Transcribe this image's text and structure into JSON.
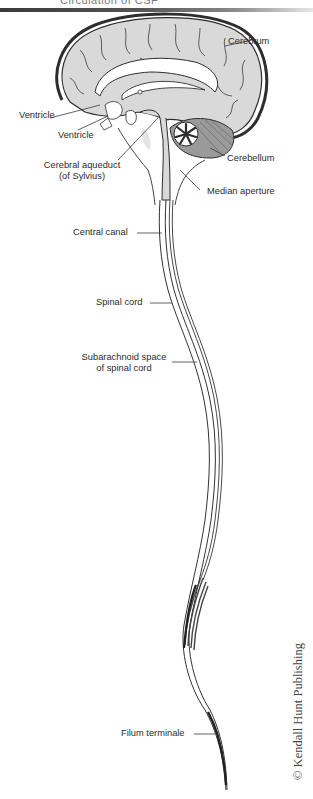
{
  "header": {
    "title": "Circulation of CSF"
  },
  "figure": {
    "type": "anatomical-diagram",
    "labels": {
      "cerebrum": "Cerebrum",
      "ventricle_1": "Ventricle",
      "ventricle_2": "Ventricle",
      "cerebellum": "Cerebellum",
      "cerebral_aqueduct_line1": "Cerebral aqueduct",
      "cerebral_aqueduct_line2": "(of Sylvius)",
      "median_aperture": "Median aperture",
      "central_canal": "Central canal",
      "spinal_cord": "Spinal cord",
      "subarachnoid_line1": "Subarachnoid space",
      "subarachnoid_line2": "of spinal cord",
      "filum_terminale": "Filum terminale"
    },
    "colors": {
      "tissue_fill": "#d9d9d9",
      "outline": "#2e2e2e",
      "ventricle_fill": "#ffffff",
      "leader_line": "#3a3a3a"
    }
  },
  "copyright": "© Kendall Hunt Publishing"
}
